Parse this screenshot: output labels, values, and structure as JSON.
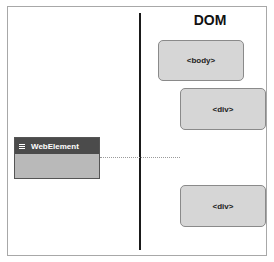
{
  "diagram": {
    "dom_title": "DOM",
    "web_element": {
      "label": "WebElement",
      "icon": "minus-box-icon",
      "header_color": "#4b4b4b",
      "body_color": "#b9b9b9"
    },
    "dom_nodes": [
      {
        "label": "<body>"
      },
      {
        "label": "<div>"
      },
      {
        "label": "<div>"
      }
    ],
    "node_color": "#d6d6d6",
    "divider_color": "#1a1a1a"
  }
}
